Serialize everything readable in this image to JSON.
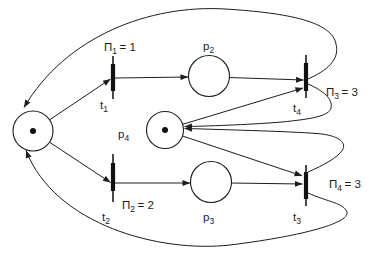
{
  "diagram": {
    "type": "petri-net",
    "colors": {
      "background": "#ffffff",
      "line": "#1c1c1c"
    },
    "places": [
      {
        "id": "p1",
        "label_main": "",
        "label_sub": "",
        "tokens": 1
      },
      {
        "id": "p2",
        "label_main": "p",
        "label_sub": "2",
        "tokens": 0
      },
      {
        "id": "p3",
        "label_main": "p",
        "label_sub": "3",
        "tokens": 0
      },
      {
        "id": "p4",
        "label_main": "p",
        "label_sub": "4",
        "tokens": 1
      }
    ],
    "transitions": [
      {
        "id": "t1",
        "label_main": "t",
        "label_sub": "1",
        "priority_sym": "Π",
        "priority_sub": "1",
        "priority_eq": "= 1"
      },
      {
        "id": "t2",
        "label_main": "t",
        "label_sub": "2",
        "priority_sym": "Π",
        "priority_sub": "2",
        "priority_eq": "= 2"
      },
      {
        "id": "t3",
        "label_main": "t",
        "label_sub": "3",
        "priority_sym": "Π",
        "priority_sub": "4",
        "priority_eq": "= 3"
      },
      {
        "id": "t4",
        "label_main": "t",
        "label_sub": "4",
        "priority_sym": "Π",
        "priority_sub": "3",
        "priority_eq": "= 3"
      }
    ],
    "arcs": [
      {
        "from": "p1",
        "to": "t1"
      },
      {
        "from": "p1",
        "to": "t2"
      },
      {
        "from": "t1",
        "to": "p2"
      },
      {
        "from": "p2",
        "to": "t4"
      },
      {
        "from": "t2",
        "to": "p3"
      },
      {
        "from": "p3",
        "to": "t3"
      },
      {
        "from": "p4",
        "to": "t4"
      },
      {
        "from": "p4",
        "to": "t3"
      },
      {
        "from": "t4",
        "to": "p4"
      },
      {
        "from": "t3",
        "to": "p4"
      },
      {
        "from": "t4",
        "to": "p1"
      },
      {
        "from": "t3",
        "to": "p1"
      }
    ]
  }
}
